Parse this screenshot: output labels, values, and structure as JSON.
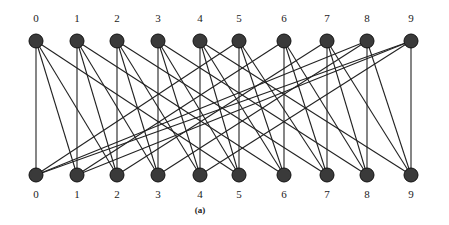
{
  "caption": "(a)",
  "top_row": {
    "y": 41,
    "labels": [
      "0",
      "1",
      "2",
      "3",
      "4",
      "5",
      "6",
      "7",
      "8",
      "9"
    ],
    "x": [
      36,
      77,
      117,
      158,
      200,
      239,
      284,
      327,
      367,
      411
    ]
  },
  "bottom_row": {
    "y": 175,
    "labels": [
      "0",
      "1",
      "2",
      "3",
      "4",
      "5",
      "6",
      "7",
      "8",
      "9"
    ],
    "x": [
      36,
      77,
      117,
      158,
      200,
      239,
      284,
      327,
      367,
      411
    ]
  },
  "edge_rule": "top i connects to bottom i, i+1, i+2, i+5 (mod 10)",
  "edge_offsets": [
    0,
    1,
    2,
    5
  ],
  "node_color": "#3a3a3a",
  "edge_color": "#222222"
}
